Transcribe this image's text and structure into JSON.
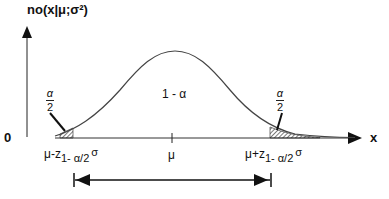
{
  "diagram": {
    "type": "normal-distribution-confidence-interval",
    "y_axis_label": "no(x|μ;σ²)",
    "x_axis_label": "x",
    "origin_label": "0",
    "center_label": "1 - α",
    "left_tail_label": {
      "num": "α",
      "den": "2"
    },
    "right_tail_label": {
      "num": "α",
      "den": "2"
    },
    "mu_label": "μ",
    "lower_bound_label": {
      "base": "μ-z",
      "sub": "1- α/2",
      "post": "σ"
    },
    "upper_bound_label": {
      "base": "μ+z",
      "sub": "1- α/2",
      "post": "σ"
    }
  }
}
